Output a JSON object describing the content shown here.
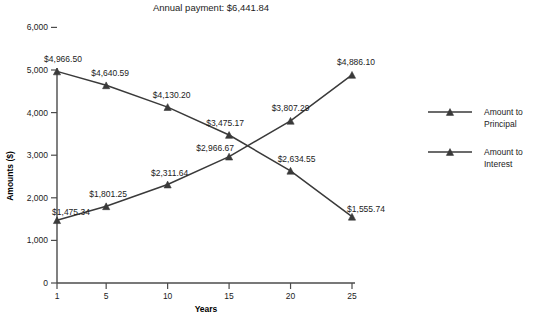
{
  "chart_data": {
    "type": "line",
    "title": "Annual payment: $6,441.84",
    "xlabel": "Years",
    "ylabel": "Amounts ($)",
    "x": [
      1,
      5,
      10,
      15,
      20,
      25
    ],
    "xtick_labels": [
      "1",
      "5",
      "10",
      "15",
      "20",
      "25"
    ],
    "ytick_labels": [
      "0",
      "1,000",
      "2,000",
      "3,000",
      "4,000",
      "5,000",
      "6,000"
    ],
    "ytick_values": [
      0,
      1000,
      2000,
      3000,
      4000,
      5000,
      6000
    ],
    "xlim": [
      1,
      25
    ],
    "ylim": [
      0,
      6000
    ],
    "grid": false,
    "legend_position": "right",
    "series": [
      {
        "name": "Amount to Principal",
        "values": [
          4966.5,
          4640.59,
          4130.2,
          3475.17,
          2634.55,
          1555.74
        ],
        "labels": [
          "$4,966.50",
          "$4,640.59",
          "$4,130.20",
          "$3,475.17",
          "$2,634.55",
          "$1,555.74"
        ],
        "color": "#3a3a3a"
      },
      {
        "name": "Amount to Interest",
        "values": [
          1475.34,
          1801.25,
          2311.64,
          2966.67,
          3807.29,
          4886.1
        ],
        "labels": [
          "$1,475.34",
          "$1,801.25",
          "$2,311.64",
          "$2,966.67",
          "$3,807.29",
          "$4,886.10"
        ],
        "color": "#3a3a3a"
      }
    ]
  },
  "legend": {
    "items": [
      {
        "line1": "Amount to",
        "line2": "Principal"
      },
      {
        "line1": "Amount to",
        "line2": "Interest"
      }
    ]
  }
}
